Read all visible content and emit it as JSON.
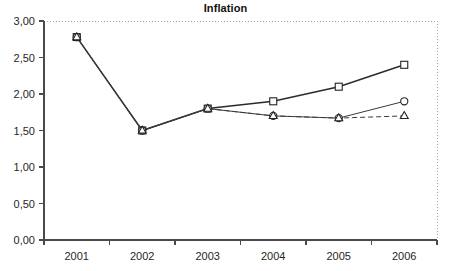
{
  "chart_data": {
    "type": "line",
    "title": "Inflation",
    "xlabel": "",
    "ylabel": "",
    "categories": [
      "2001",
      "2002",
      "2003",
      "2004",
      "2005",
      "2006"
    ],
    "ylim": [
      0,
      3
    ],
    "ytick_labels": [
      "0,00",
      "0,50",
      "1,00",
      "1,50",
      "2,00",
      "2,50",
      "3,00"
    ],
    "ytick_values": [
      0,
      0.5,
      1,
      1.5,
      2,
      2.5,
      3
    ],
    "grid": false,
    "legend": "none",
    "decimal_separator": ",",
    "series": [
      {
        "name": "square-series",
        "marker": "square",
        "line_style": "solid",
        "values": [
          2.78,
          1.5,
          1.8,
          1.9,
          2.1,
          2.4
        ]
      },
      {
        "name": "circle-series",
        "marker": "circle",
        "line_style": "solid",
        "values": [
          2.78,
          1.5,
          1.8,
          1.7,
          1.67,
          1.9
        ]
      },
      {
        "name": "triangle-series",
        "marker": "triangle",
        "line_style": "dashed",
        "values": [
          2.78,
          1.5,
          1.8,
          1.7,
          1.67,
          1.7
        ]
      }
    ]
  },
  "colors": {
    "axis": "#4a4a4a",
    "frame_dotted": "#a9a9a9",
    "series_stroke": "#232323",
    "background": "#ffffff",
    "text": "#1f1f1f"
  }
}
